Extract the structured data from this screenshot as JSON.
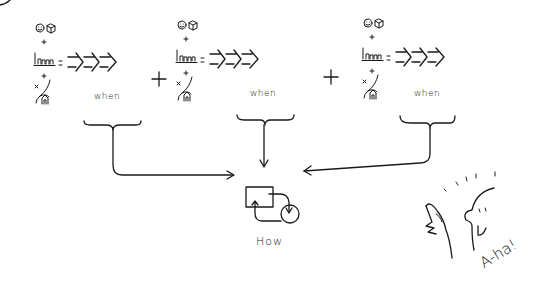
{
  "diagram": {
    "formulas": [
      {
        "id": "formula-1",
        "components": [
          "person-icon",
          "product-box-icon",
          "bar-chart-icon",
          "location-path-icon"
        ],
        "operators": [
          "+",
          "+",
          "="
        ],
        "result": "arrows",
        "label": "when"
      },
      {
        "id": "formula-2",
        "components": [
          "person-icon",
          "product-box-icon",
          "bar-chart-icon",
          "location-path-icon"
        ],
        "operators": [
          "+",
          "+",
          "="
        ],
        "result": "arrows",
        "label": "when"
      },
      {
        "id": "formula-3",
        "components": [
          "person-icon",
          "product-box-icon",
          "bar-chart-icon",
          "location-path-icon"
        ],
        "operators": [
          "+",
          "+",
          "="
        ],
        "result": "arrows",
        "label": "when"
      }
    ],
    "joiners": [
      "+",
      "+"
    ],
    "outcome": {
      "icon": "process-cycle-icon",
      "label": "How"
    },
    "character": {
      "icon": "thinking-person-icon",
      "exclamation": "A-ha!"
    },
    "ink_color": "#1a1a1a",
    "background_color": "#ffffff"
  }
}
